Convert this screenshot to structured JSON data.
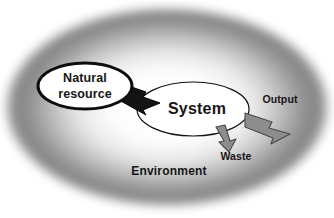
{
  "diagram": {
    "background_color": "#ffffff",
    "environment": {
      "label": "Environment",
      "label_x": 169,
      "label_y": 172,
      "shape": "ellipse-radial-gradient",
      "center_x": 167,
      "center_y": 107,
      "radius_x": 165,
      "radius_y": 102,
      "core_color": "#ffffff",
      "edge_color": "#7d7d7d",
      "outer_color": "#ffffff"
    },
    "nodes": [
      {
        "id": "natural-resource",
        "label_line_1": "Natural",
        "label_line_2": "resource",
        "shape": "ellipse",
        "center_x": 85,
        "center_y": 86,
        "radius_x": 47,
        "radius_y": 23,
        "fill": "#ffffff",
        "stroke": "#0d0d0d",
        "stroke_width": 3
      },
      {
        "id": "system",
        "label": "System",
        "shape": "ellipse",
        "center_x": 193,
        "center_y": 109,
        "radius_x": 56,
        "radius_y": 27,
        "fill": "#ffffff",
        "stroke": "#111111",
        "stroke_width": 1.2
      }
    ],
    "arrows": [
      {
        "id": "input-arrow",
        "from": "natural-resource",
        "to": "system",
        "label": "",
        "fill": "#141414",
        "stroke": "#000000",
        "direction": "right-down"
      },
      {
        "id": "output-arrow",
        "from": "system",
        "to": "environment",
        "label": "Output",
        "label_x": 280,
        "label_y": 100,
        "fill": "#8d8d8d",
        "stroke": "#4a4a4a",
        "direction": "right-down"
      },
      {
        "id": "waste-arrow",
        "from": "system",
        "to": "environment",
        "label": "Waste",
        "label_x": 236,
        "label_y": 157,
        "fill": "#8d8d8d",
        "stroke": "#4a4a4a",
        "direction": "down"
      }
    ]
  }
}
